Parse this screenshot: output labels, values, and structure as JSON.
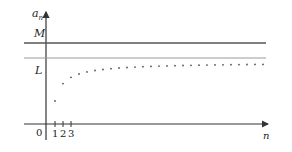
{
  "chart_data": {
    "type": "scatter",
    "title": "",
    "xlabel": "n",
    "ylabel": "a_n",
    "origin_label": "0",
    "x_tick_labels": [
      "1",
      "2",
      "3"
    ],
    "reference_lines": [
      {
        "label": "M",
        "description": "upper bound",
        "y_px": 43,
        "color": "#555555"
      },
      {
        "label": "L",
        "description": "limit",
        "y_px": 58,
        "color": "#999999"
      }
    ],
    "n": [
      1,
      2,
      3,
      4,
      5,
      6,
      7,
      8,
      9,
      10,
      11,
      12,
      13,
      14,
      15,
      16,
      17,
      18,
      19,
      20,
      21,
      22,
      23,
      24,
      25,
      26,
      27
    ],
    "grid": false,
    "legend": null
  },
  "labels": {
    "y_axis": "a",
    "y_axis_sub": "n",
    "x_axis": "n",
    "M": "M",
    "L": "L",
    "origin": "0",
    "tick1": "1",
    "tick2": "2",
    "tick3": "3"
  },
  "colors": {
    "axis": "#333333",
    "upper_bound_line": "#555555",
    "limit_line": "#9a9a9a",
    "points": "#555555"
  }
}
